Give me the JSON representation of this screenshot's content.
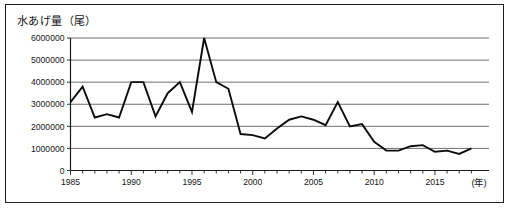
{
  "chart_data": {
    "type": "line",
    "title": "水あげ量（尾）",
    "xlabel": "(年)",
    "ylabel": "水あげ量（尾）",
    "xlim": [
      1985,
      2018
    ],
    "ylim": [
      0,
      6000000
    ],
    "grid": true,
    "legend": "none",
    "y_ticks": [
      0,
      1000000,
      2000000,
      3000000,
      4000000,
      5000000,
      6000000
    ],
    "y_tick_labels": [
      "0",
      "1000000",
      "2000000",
      "3000000",
      "4000000",
      "5000000",
      "6000000"
    ],
    "x_ticks": [
      1985,
      1990,
      1995,
      2000,
      2005,
      2010,
      2015
    ],
    "x_tick_labels": [
      "1985",
      "1990",
      "1995",
      "2000",
      "2005",
      "2010",
      "2015"
    ],
    "x": [
      1985,
      1986,
      1987,
      1988,
      1989,
      1990,
      1991,
      1992,
      1993,
      1994,
      1995,
      1996,
      1997,
      1998,
      1999,
      2000,
      2001,
      2002,
      2003,
      2004,
      2005,
      2006,
      2007,
      2008,
      2009,
      2010,
      2011,
      2012,
      2013,
      2014,
      2015,
      2016,
      2017,
      2018
    ],
    "values": [
      3100000,
      3800000,
      2400000,
      2550000,
      2400000,
      4000000,
      4000000,
      2450000,
      3500000,
      4000000,
      2650000,
      6000000,
      4000000,
      3700000,
      1650000,
      1600000,
      1450000,
      1900000,
      2300000,
      2450000,
      2300000,
      2050000,
      3100000,
      2000000,
      2100000,
      1300000,
      900000,
      900000,
      1100000,
      1150000,
      850000,
      900000,
      750000,
      1000000
    ],
    "series": [
      {
        "name": "水あげ量",
        "values": [
          3100000,
          3800000,
          2400000,
          2550000,
          2400000,
          4000000,
          4000000,
          2450000,
          3500000,
          4000000,
          2650000,
          6000000,
          4000000,
          3700000,
          1650000,
          1600000,
          1450000,
          1900000,
          2300000,
          2450000,
          2300000,
          2050000,
          3100000,
          2000000,
          2100000,
          1300000,
          900000,
          900000,
          1100000,
          1150000,
          850000,
          900000,
          750000,
          1000000
        ]
      }
    ],
    "colors": {
      "line": "#0d0d0d",
      "grid": "#4a4a4a",
      "axis": "#1b1b1b",
      "background": "#ffffff"
    }
  }
}
